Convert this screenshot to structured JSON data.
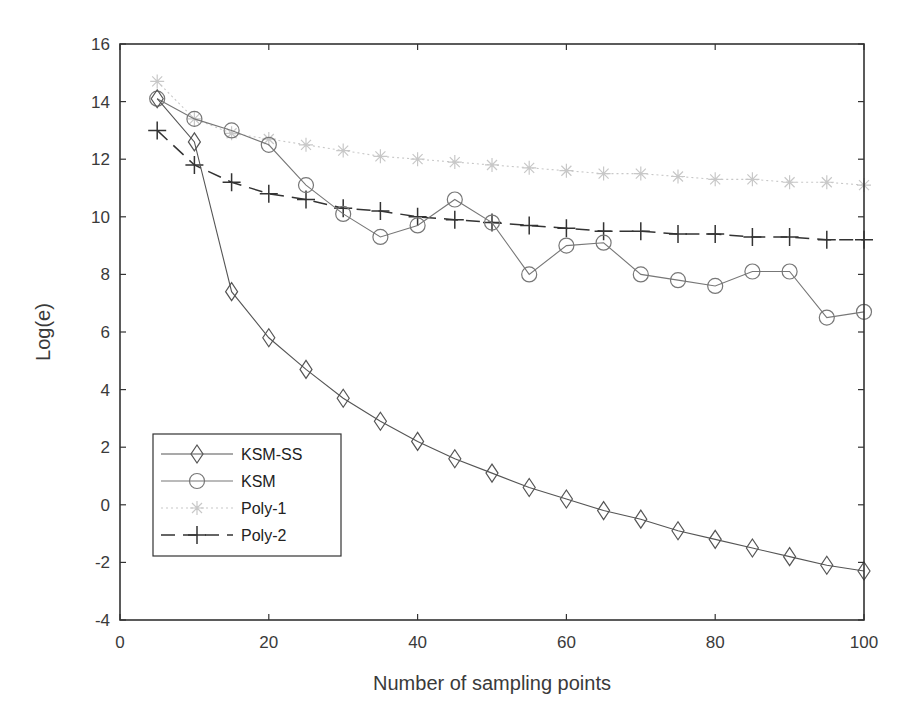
{
  "chart_data": {
    "type": "line",
    "title": "",
    "xlabel": "Number of sampling points",
    "ylabel": "Log(e)",
    "xlim": [
      0,
      100
    ],
    "ylim": [
      -4,
      16
    ],
    "xticks": [
      0,
      20,
      40,
      60,
      80,
      100
    ],
    "yticks": [
      -4,
      -2,
      0,
      2,
      4,
      6,
      8,
      10,
      12,
      14,
      16
    ],
    "grid": false,
    "legend_position": "lower left",
    "x": [
      5,
      10,
      15,
      20,
      25,
      30,
      35,
      40,
      45,
      50,
      55,
      60,
      65,
      70,
      75,
      80,
      85,
      90,
      95,
      100
    ],
    "series": [
      {
        "name": "KSM-SS",
        "marker": "diamond",
        "line": "solid",
        "color": "#555555",
        "values": [
          14.1,
          12.6,
          7.4,
          5.8,
          4.7,
          3.7,
          2.9,
          2.2,
          1.6,
          1.1,
          0.6,
          0.2,
          -0.2,
          -0.5,
          -0.9,
          -1.2,
          -1.5,
          -1.8,
          -2.1,
          -2.3
        ]
      },
      {
        "name": "KSM",
        "marker": "circle",
        "line": "solid",
        "color": "#777777",
        "values": [
          14.1,
          13.4,
          13.0,
          12.5,
          11.1,
          10.1,
          9.3,
          9.7,
          10.6,
          9.8,
          8.0,
          9.0,
          9.1,
          8.0,
          7.8,
          7.6,
          8.1,
          8.1,
          6.5,
          6.7
        ]
      },
      {
        "name": "Poly-1",
        "marker": "star",
        "line": "dotted",
        "color": "#c8c8c8",
        "values": [
          14.7,
          13.4,
          12.9,
          12.7,
          12.5,
          12.3,
          12.1,
          12.0,
          11.9,
          11.8,
          11.7,
          11.6,
          11.5,
          11.5,
          11.4,
          11.3,
          11.3,
          11.2,
          11.2,
          11.1
        ]
      },
      {
        "name": "Poly-2",
        "marker": "plus",
        "line": "dashed",
        "color": "#333333",
        "values": [
          13.0,
          11.8,
          11.2,
          10.8,
          10.6,
          10.3,
          10.2,
          10.0,
          9.9,
          9.8,
          9.7,
          9.6,
          9.5,
          9.5,
          9.4,
          9.4,
          9.3,
          9.3,
          9.2,
          9.2
        ]
      }
    ]
  }
}
